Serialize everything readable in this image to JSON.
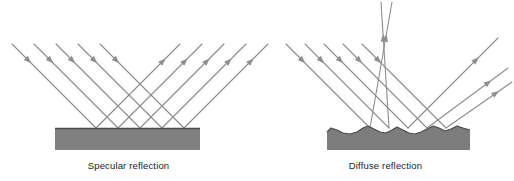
{
  "figure": {
    "type": "physics-optics-diagram",
    "background_color": "#ffffff"
  },
  "style": {
    "ray_color": "#8d8d8d",
    "surface_fill": "#808080",
    "surface_edge": "#4a4a4a",
    "rough_surface_fill": "#7d7d7d",
    "text_color": "#1b1b1b",
    "ray_stroke_width": 1.1
  },
  "panels": [
    {
      "id": "specular",
      "caption": "Specular reflection",
      "surface": {
        "kind": "smooth-slab",
        "x": 55,
        "y": 128,
        "width": 145,
        "height": 22
      },
      "incident_rays": [
        {
          "x1": 12,
          "y1": 44,
          "x2": 96,
          "y2": 128,
          "arrow_t": 0.2
        },
        {
          "x1": 34,
          "y1": 44,
          "x2": 118,
          "y2": 128,
          "arrow_t": 0.2
        },
        {
          "x1": 56,
          "y1": 44,
          "x2": 140,
          "y2": 128,
          "arrow_t": 0.2
        },
        {
          "x1": 78,
          "y1": 44,
          "x2": 162,
          "y2": 128,
          "arrow_t": 0.2
        },
        {
          "x1": 100,
          "y1": 44,
          "x2": 184,
          "y2": 128,
          "arrow_t": 0.2
        }
      ],
      "reflected_rays": [
        {
          "x1": 96,
          "y1": 128,
          "x2": 180,
          "y2": 44,
          "arrow_t": 0.8
        },
        {
          "x1": 118,
          "y1": 128,
          "x2": 202,
          "y2": 44,
          "arrow_t": 0.8
        },
        {
          "x1": 140,
          "y1": 128,
          "x2": 224,
          "y2": 44,
          "arrow_t": 0.8
        },
        {
          "x1": 162,
          "y1": 128,
          "x2": 246,
          "y2": 44,
          "arrow_t": 0.8
        },
        {
          "x1": 184,
          "y1": 128,
          "x2": 268,
          "y2": 44,
          "arrow_t": 0.8
        }
      ]
    },
    {
      "id": "diffuse",
      "caption": "Diffuse reflection",
      "surface": {
        "kind": "rough-slab",
        "x": 327,
        "y": 128,
        "width": 143,
        "height": 22,
        "profile_points": "327,132 331,128 337,130 343,133 350,134 357,132 363,128 368,126 374,129 380,132 386,133 392,130 397,127 403,130 409,133 415,134 421,132 427,129 433,126 439,128 445,131 451,129 457,126 463,128 470,130"
      },
      "incident_rays": [
        {
          "x1": 286,
          "y1": 44,
          "x2": 370,
          "y2": 128,
          "arrow_t": 0.2
        },
        {
          "x1": 305,
          "y1": 44,
          "x2": 389,
          "y2": 128,
          "arrow_t": 0.2
        },
        {
          "x1": 324,
          "y1": 44,
          "x2": 408,
          "y2": 128,
          "arrow_t": 0.2
        },
        {
          "x1": 343,
          "y1": 44,
          "x2": 427,
          "y2": 128,
          "arrow_t": 0.2
        },
        {
          "x1": 362,
          "y1": 44,
          "x2": 446,
          "y2": 128,
          "arrow_t": 0.2
        }
      ],
      "reflected_rays": [
        {
          "x1": 370,
          "y1": 128,
          "x2": 392,
          "y2": 2,
          "arrow_t": 0.72
        },
        {
          "x1": 389,
          "y1": 128,
          "x2": 381,
          "y2": 2,
          "arrow_t": 0.72
        },
        {
          "x1": 408,
          "y1": 128,
          "x2": 498,
          "y2": 38,
          "arrow_t": 0.76
        },
        {
          "x1": 427,
          "y1": 128,
          "x2": 508,
          "y2": 68,
          "arrow_t": 0.76
        },
        {
          "x1": 446,
          "y1": 128,
          "x2": 512,
          "y2": 82,
          "arrow_t": 0.76
        }
      ]
    }
  ]
}
